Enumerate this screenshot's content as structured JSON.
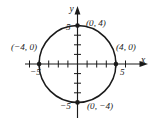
{
  "figure": {
    "name": "circle-graph",
    "axes": {
      "x_label": "x",
      "y_label": "y",
      "x_ticks": [
        {
          "value": -5,
          "label": "−5"
        },
        {
          "value": 5,
          "label": "5"
        }
      ],
      "y_ticks": [
        {
          "value": 5,
          "label": "5"
        },
        {
          "value": -5,
          "label": "−5"
        }
      ],
      "x_range": [
        -5.8,
        5.8
      ],
      "y_range": [
        -5.8,
        5.8
      ],
      "minor_tick_values": [
        -4,
        -3,
        -2,
        -1,
        1,
        2,
        3,
        4
      ],
      "grid": false,
      "arrowheads": true
    },
    "curve": {
      "type": "circle",
      "center": [
        0,
        0
      ],
      "radius": 4,
      "stroke": "#1a1a1a"
    },
    "points": [
      {
        "id": "top",
        "x": 0,
        "y": 4,
        "label": "(0, 4)"
      },
      {
        "id": "right",
        "x": 4,
        "y": 0,
        "label": "(4, 0)"
      },
      {
        "id": "bottom",
        "x": 0,
        "y": -4,
        "label": "(0, −4)"
      },
      {
        "id": "left",
        "x": -4,
        "y": 0,
        "label": "(−4, 0)"
      }
    ],
    "colors": {
      "ink": "#1a1a1a",
      "background": "#ffffff"
    }
  }
}
